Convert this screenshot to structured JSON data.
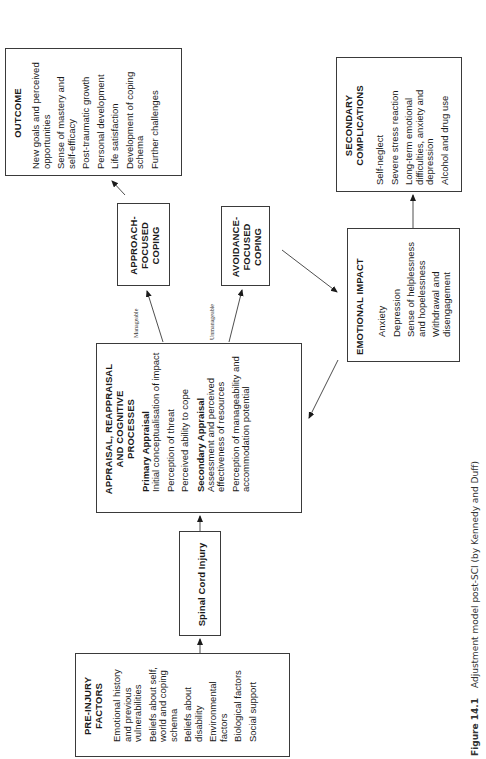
{
  "diagram": {
    "nodes": {
      "outcome": {
        "title": "OUTCOME",
        "items": [
          "New goals and perceived opportunities",
          "Sense of mastery and self-efficacy",
          "Post-traumatic growth",
          "Personal development",
          "Life satisfaction",
          "Development of coping schema",
          "Further challenges"
        ]
      },
      "secondary_complications": {
        "title": "SECONDARY COMPLICATIONS",
        "items": [
          "Self-neglect",
          "Severe stress reaction",
          "Long-term emotional difficulties, anxiety and depression",
          "Alcohol and drug use"
        ]
      },
      "approach_coping": {
        "title": "APPROACH-FOCUSED COPING"
      },
      "avoidance_coping": {
        "title": "AVOIDANCE-FOCUSED COPING"
      },
      "emotional_impact": {
        "title": "EMOTIONAL IMPACT",
        "items": [
          "Anxiety",
          "Depression",
          "Sense of helplessness and hopelessness",
          "Withdrawal and disengagement"
        ]
      },
      "appraisal": {
        "title": "APPRAISAL, REAPPRAISAL AND COGNITIVE PROCESSES",
        "primary": {
          "title": "Primary Appraisal",
          "items": [
            "Initial conceptualisation of impact",
            "Perception of threat",
            "Perceived ability to cope"
          ]
        },
        "secondary": {
          "title": "Secondary Appraisal",
          "items": [
            "Assessment and perceived effectiveness of resources",
            "Perception of manageability and accommodation potential"
          ]
        }
      },
      "spinal_cord_injury": {
        "title": "Spinal Cord Injury"
      },
      "pre_injury": {
        "title": "PRE-INJURY FACTORS",
        "items": [
          "Emotional history and previous vulnerabilities",
          "Beliefs about self, world and coping schema",
          "Beliefs about disability",
          "Environmental factors",
          "Biological factors",
          "Social support"
        ]
      }
    },
    "edges": [
      {
        "from": "pre_injury",
        "to": "spinal_cord_injury",
        "label": ""
      },
      {
        "from": "spinal_cord_injury",
        "to": "appraisal",
        "label": ""
      },
      {
        "from": "appraisal",
        "to": "approach_coping",
        "label": "Manageable"
      },
      {
        "from": "appraisal",
        "to": "avoidance_coping",
        "label": "Unmanageable"
      },
      {
        "from": "approach_coping",
        "to": "outcome",
        "label": ""
      },
      {
        "from": "avoidance_coping",
        "to": "emotional_impact",
        "label": ""
      },
      {
        "from": "emotional_impact",
        "to": "secondary_complications",
        "label": ""
      },
      {
        "from": "emotional_impact",
        "to": "appraisal",
        "label": ""
      },
      {
        "from": "primary_appraisal",
        "to": "secondary_appraisal",
        "label": ""
      },
      {
        "from": "secondary_appraisal",
        "to": "primary_appraisal",
        "label": ""
      }
    ],
    "edge_labels": {
      "manageable": "Manageable",
      "unmanageable": "Unmanageable"
    }
  },
  "caption": {
    "figure_number": "Figure 14.1",
    "text": "Adjustment model post-SCI (by Kennedy and Duff)"
  },
  "colors": {
    "line": "#3a3a3a",
    "background": "#ffffff",
    "text": "#1a1a1a"
  }
}
